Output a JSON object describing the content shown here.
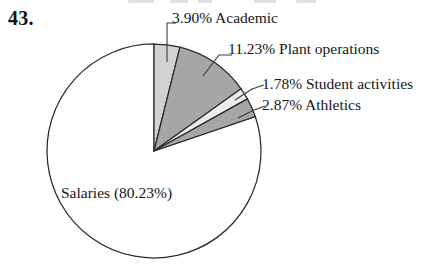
{
  "figure": {
    "item_number": "43.",
    "pie_center_x": 154,
    "pie_center_y": 151,
    "pie_radius": 107
  },
  "chart_data": {
    "type": "pie",
    "title": "",
    "categories": [
      "Academic",
      "Plant operations",
      "Student activities",
      "Athletics",
      "Salaries"
    ],
    "values": [
      3.9,
      11.23,
      1.78,
      2.87,
      80.23
    ],
    "unit": "%",
    "start_angle_deg": 0,
    "direction": "clockwise",
    "legend": "none",
    "labels": [
      {
        "name": "academic",
        "text": "3.90% Academic",
        "percent": 3.9,
        "fill": "#d2d2d2",
        "placement": "outside"
      },
      {
        "name": "plant-operations",
        "text": "11.23% Plant operations",
        "percent": 11.23,
        "fill": "#a6a6a6",
        "placement": "outside"
      },
      {
        "name": "student-activities",
        "text": "1.78% Student activities",
        "percent": 1.78,
        "fill": "#ececec",
        "placement": "outside"
      },
      {
        "name": "athletics",
        "text": "2.87% Athletics",
        "percent": 2.87,
        "fill": "#a6a6a6",
        "placement": "outside"
      },
      {
        "name": "salaries",
        "text": "Salaries (80.23%)",
        "percent": 80.23,
        "fill": "#ffffff",
        "placement": "inside"
      }
    ],
    "stroke_color": "#2b2b2b",
    "background": "#ffffff"
  }
}
